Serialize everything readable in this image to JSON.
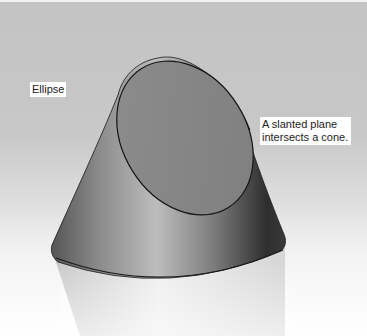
{
  "figure": {
    "labels": {
      "ellipse": "Ellipse",
      "plane_line1": "A slanted plane",
      "plane_line2": "intersects a cone."
    },
    "colors": {
      "background_top": "#c3c3c3",
      "background_bottom": "#ffffff",
      "cone_dark": "#3a3a3a",
      "cone_light": "#b8b8b8",
      "ellipse_face": "#8a8a8a",
      "outline": "#1a1a1a",
      "label_bg": "#ffffff"
    }
  }
}
